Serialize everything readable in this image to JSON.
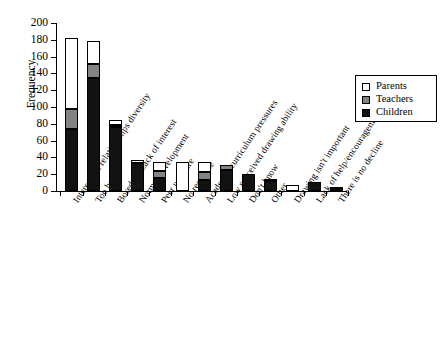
{
  "chart_data": {
    "type": "bar",
    "subtype": "stacked-vertical",
    "title": "",
    "xlabel": "",
    "ylabel": "Frequency",
    "ylim": [
      0,
      200
    ],
    "ytick_values": [
      0,
      20,
      40,
      60,
      80,
      100,
      120,
      140,
      160,
      180,
      200
    ],
    "ytick_labels": [
      "0",
      "20",
      "40",
      "60",
      "80",
      "100",
      "120",
      "140",
      "160",
      "180",
      "200"
    ],
    "grid": false,
    "legend_position": "upper right",
    "categories": [
      "Interests & relationships diversity",
      "Too busy",
      "Boredom/Lack of interest",
      "Normal development",
      "Peer pressure",
      "No response",
      "Academic/curriculum pressures",
      "Low perceived drawing ability",
      "Don't know",
      "Other",
      "Drawing isn't important",
      "Lack of help/encouragement",
      "There is no decline"
    ],
    "series": [
      {
        "name": "Children",
        "color": "#121212",
        "values": [
          74,
          134,
          76,
          33,
          15,
          0,
          13,
          25,
          20,
          12,
          0,
          11,
          0
        ]
      },
      {
        "name": "Teachers",
        "color": "#838383",
        "values": [
          24,
          17,
          2,
          0,
          9,
          0,
          10,
          6,
          0,
          0,
          0,
          0,
          1
        ]
      },
      {
        "name": "Parents",
        "color": "#ffffff",
        "values": [
          84,
          28,
          6,
          4,
          10,
          34,
          11,
          0,
          0,
          2,
          7,
          0,
          2
        ]
      }
    ],
    "totals": [
      182,
      179,
      84,
      37,
      34,
      34,
      34,
      31,
      20,
      14,
      7,
      11,
      3
    ]
  },
  "legend": {
    "items": [
      {
        "label": "Parents",
        "swatch": "#ffffff"
      },
      {
        "label": "Teachers",
        "swatch": "#838383"
      },
      {
        "label": "Children",
        "swatch": "#121212"
      }
    ]
  },
  "axes": {
    "y_title": "Frequency"
  }
}
